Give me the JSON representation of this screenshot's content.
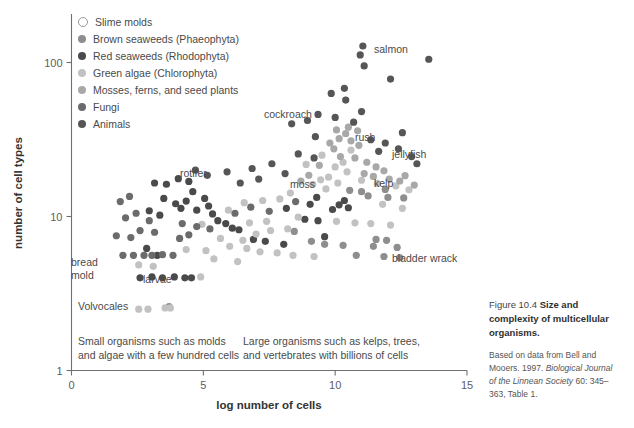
{
  "figure": {
    "number": "Figure 10.4",
    "title": "Size and complexity of multicellular organisms.",
    "source_prefix": "Based on data from Bell and Mooers. 1997. ",
    "source_italic": "Biological Journal of the Linnean Society",
    "source_suffix": " 60: 345–363, Table 1."
  },
  "legend": {
    "items": [
      {
        "label": "Slime molds",
        "color": "#ffffff",
        "outline": "#9a9a9a",
        "hollow": true
      },
      {
        "label": "Brown seaweeds (Phaeophyta)",
        "color": "#8e8e8e",
        "hollow": false
      },
      {
        "label": "Red seaweeds (Rhodophyta)",
        "color": "#4a4a4a",
        "hollow": false
      },
      {
        "label": "Green algae (Chlorophyta)",
        "color": "#c2c2c2",
        "hollow": false
      },
      {
        "label": "Mosses, ferns, and seed plants",
        "color": "#a8a8a8",
        "hollow": false
      },
      {
        "label": "Fungi",
        "color": "#6b6b6b",
        "hollow": false
      },
      {
        "label": "Animals",
        "color": "#565656",
        "hollow": false
      }
    ]
  },
  "annotations": [
    {
      "text": "salmon",
      "x": 374,
      "y": 43
    },
    {
      "text": "cockroach",
      "x": 264,
      "y": 108
    },
    {
      "text": "rush",
      "x": 355,
      "y": 131
    },
    {
      "text": "jellyfish",
      "x": 392,
      "y": 148
    },
    {
      "text": "rotifer",
      "x": 180,
      "y": 167
    },
    {
      "text": "moss",
      "x": 290,
      "y": 178
    },
    {
      "text": "kelp",
      "x": 374,
      "y": 177
    },
    {
      "text": "bladder wrack",
      "x": 392,
      "y": 252
    },
    {
      "text": "bread\nmold",
      "x": 71,
      "y": 256
    },
    {
      "text": "larvae",
      "x": 143,
      "y": 273
    },
    {
      "text": "Volvocales",
      "x": 78,
      "y": 300
    }
  ],
  "region_notes": [
    {
      "text": "Small organisms such as molds\nand algae with a few hundred cells",
      "x": 78,
      "y": 335
    },
    {
      "text": "Large organisms such as kelps, trees,\nand vertebrates with billions of cells",
      "x": 243,
      "y": 335
    }
  ],
  "chart_data": {
    "type": "scatter",
    "title": "Size and complexity of multicellular organisms",
    "xlabel": "log number of cells",
    "ylabel": "number of cell types",
    "xlim": [
      0,
      15
    ],
    "ylim": [
      1,
      200
    ],
    "yscale": "log",
    "xticks": [
      0,
      5,
      10,
      15
    ],
    "yticks": [
      1,
      10,
      100
    ],
    "grid": false,
    "legend_position": "top-left",
    "series": [
      {
        "name": "Slime molds",
        "color": "#ffffff",
        "outline": "#8f8f8f",
        "hollow": true,
        "points": [
          [
            4.05,
            2.55
          ]
        ]
      },
      {
        "name": "Brown seaweeds (Phaeophyta)",
        "color": "#8e8e8e",
        "points": [
          [
            3.7,
            2.6
          ],
          [
            11.0,
            14.5
          ],
          [
            11.25,
            13.6
          ],
          [
            12.0,
            13.3
          ],
          [
            10.55,
            14.8
          ],
          [
            11.55,
            7.1
          ],
          [
            11.95,
            7.0
          ],
          [
            11.45,
            6.4
          ],
          [
            12.35,
            6.3
          ],
          [
            9.1,
            6.9
          ],
          [
            9.6,
            6.6
          ],
          [
            10.3,
            6.5
          ],
          [
            12.6,
            13.2
          ],
          [
            11.9,
            15.0
          ],
          [
            8.45,
            8.0
          ],
          [
            10.8,
            5.6
          ],
          [
            11.85,
            5.5
          ],
          [
            12.45,
            5.4
          ]
        ]
      },
      {
        "name": "Red seaweeds (Rhodophyta)",
        "color": "#4a4a4a",
        "points": [
          [
            2.6,
            4.0
          ],
          [
            3.05,
            4.05
          ],
          [
            3.45,
            4.0
          ],
          [
            3.9,
            4.05
          ],
          [
            4.3,
            4.0
          ],
          [
            3.25,
            5.6
          ],
          [
            4.55,
            4.0
          ],
          [
            2.85,
            6.2
          ],
          [
            3.5,
            13.1
          ],
          [
            3.95,
            12.1
          ],
          [
            4.35,
            12.6
          ],
          [
            4.6,
            14.5
          ],
          [
            4.15,
            11.3
          ],
          [
            4.75,
            11.0
          ],
          [
            5.05,
            13.1
          ],
          [
            5.35,
            10.4
          ],
          [
            5.55,
            9.4
          ],
          [
            5.85,
            9.0
          ],
          [
            6.1,
            8.4
          ],
          [
            5.2,
            11.7
          ],
          [
            3.15,
            16.5
          ],
          [
            3.6,
            16.2
          ],
          [
            4.05,
            17.6
          ],
          [
            4.45,
            16.9
          ],
          [
            2.95,
            10.9
          ],
          [
            3.35,
            10.2
          ],
          [
            6.35,
            8.2
          ],
          [
            9.3,
            13.3
          ],
          [
            9.05,
            12.0
          ],
          [
            8.15,
            11.3
          ],
          [
            8.85,
            9.6
          ],
          [
            9.35,
            9.4
          ],
          [
            6.9,
            7.1
          ],
          [
            7.35,
            6.9
          ],
          [
            8.05,
            6.6
          ],
          [
            9.9,
            11.1
          ],
          [
            10.15,
            11.9
          ],
          [
            10.5,
            11.4
          ],
          [
            10.35,
            12.7
          ],
          [
            9.6,
            7.4
          ]
        ]
      },
      {
        "name": "Green algae (Chlorophyta)",
        "color": "#c2c2c2",
        "points": [
          [
            2.55,
            2.5
          ],
          [
            2.9,
            2.5
          ],
          [
            3.55,
            2.55
          ],
          [
            3.75,
            2.55
          ],
          [
            2.55,
            4.85
          ],
          [
            3.1,
            4.75
          ],
          [
            4.9,
            4.05
          ],
          [
            5.4,
            5.3
          ],
          [
            6.3,
            5.1
          ],
          [
            4.35,
            6.1
          ],
          [
            5.1,
            6.0
          ],
          [
            6.0,
            6.4
          ],
          [
            6.65,
            6.2
          ],
          [
            7.15,
            5.9
          ],
          [
            7.8,
            5.8
          ],
          [
            8.4,
            5.6
          ],
          [
            9.2,
            5.5
          ],
          [
            5.65,
            7.2
          ],
          [
            6.5,
            7.0
          ],
          [
            7.0,
            7.7
          ],
          [
            7.55,
            8.1
          ],
          [
            8.2,
            8.3
          ],
          [
            6.75,
            9.1
          ],
          [
            7.4,
            9.3
          ],
          [
            8.6,
            9.9
          ],
          [
            10.05,
            9.3
          ],
          [
            10.75,
            9.1
          ],
          [
            11.35,
            9.0
          ],
          [
            12.1,
            8.8
          ],
          [
            9.45,
            17.3
          ],
          [
            9.75,
            18.0
          ],
          [
            10.1,
            16.5
          ],
          [
            10.45,
            19.5
          ],
          [
            10.0,
            21.0
          ],
          [
            10.3,
            22.5
          ],
          [
            9.65,
            15.1
          ],
          [
            11.0,
            17.2
          ],
          [
            11.6,
            16.4
          ],
          [
            12.3,
            15.8
          ],
          [
            12.8,
            14.9
          ],
          [
            8.9,
            21.8
          ],
          [
            9.5,
            25.0
          ],
          [
            10.6,
            27.0
          ],
          [
            7.9,
            13.0
          ],
          [
            8.3,
            14.2
          ],
          [
            9.15,
            16.2
          ],
          [
            11.8,
            12.0
          ],
          [
            12.55,
            11.3
          ],
          [
            5.95,
            11.0
          ],
          [
            6.55,
            12.3
          ],
          [
            7.25,
            12.7
          ],
          [
            4.95,
            8.9
          ]
        ]
      },
      {
        "name": "Mosses, ferns, and seed plants",
        "color": "#a8a8a8",
        "points": [
          [
            9.8,
            30.0
          ],
          [
            10.15,
            32.0
          ],
          [
            10.4,
            34.5
          ],
          [
            10.05,
            36.5
          ],
          [
            10.6,
            31.0
          ],
          [
            10.9,
            29.0
          ],
          [
            9.95,
            27.5
          ],
          [
            10.75,
            24.0
          ],
          [
            11.2,
            22.5
          ],
          [
            11.55,
            21.0
          ],
          [
            10.2,
            24.5
          ],
          [
            9.4,
            21.5
          ],
          [
            11.1,
            19.0
          ],
          [
            11.45,
            18.2
          ],
          [
            12.05,
            17.5
          ],
          [
            12.45,
            17.0
          ],
          [
            9.0,
            18.5
          ],
          [
            8.7,
            17.0
          ],
          [
            11.85,
            19.8
          ],
          [
            12.65,
            18.4
          ],
          [
            13.0,
            16.0
          ],
          [
            10.85,
            36.0
          ],
          [
            10.5,
            38.0
          ]
        ]
      },
      {
        "name": "Fungi",
        "color": "#6b6b6b",
        "points": [
          [
            1.95,
            5.6
          ],
          [
            2.35,
            5.6
          ],
          [
            2.75,
            5.6
          ],
          [
            3.05,
            5.6
          ],
          [
            3.45,
            5.65
          ],
          [
            3.85,
            5.6
          ],
          [
            1.7,
            7.5
          ],
          [
            2.25,
            7.3
          ],
          [
            2.6,
            8.1
          ],
          [
            3.15,
            7.9
          ],
          [
            4.1,
            7.2
          ],
          [
            4.45,
            7.6
          ],
          [
            2.05,
            9.8
          ],
          [
            2.45,
            10.5
          ],
          [
            2.95,
            9.4
          ],
          [
            4.75,
            8.6
          ],
          [
            5.25,
            8.3
          ],
          [
            1.85,
            12.5
          ],
          [
            2.2,
            13.5
          ],
          [
            6.2,
            10.5
          ],
          [
            6.8,
            11.5
          ],
          [
            7.5,
            10.8
          ],
          [
            8.5,
            12.5
          ],
          [
            4.2,
            9.0
          ]
        ]
      },
      {
        "name": "Animals",
        "color": "#565656",
        "points": [
          [
            10.95,
            112.0
          ],
          [
            11.05,
            128.0
          ],
          [
            11.1,
            95.0
          ],
          [
            13.55,
            105.0
          ],
          [
            12.1,
            78.0
          ],
          [
            10.4,
            57.0
          ],
          [
            9.85,
            63.0
          ],
          [
            10.35,
            68.0
          ],
          [
            9.35,
            46.0
          ],
          [
            10.0,
            44.0
          ],
          [
            11.0,
            48.0
          ],
          [
            8.95,
            42.0
          ],
          [
            8.35,
            40.0
          ],
          [
            9.25,
            33.0
          ],
          [
            11.35,
            31.5
          ],
          [
            11.9,
            30.0
          ],
          [
            12.4,
            27.5
          ],
          [
            8.6,
            25.5
          ],
          [
            9.2,
            24.0
          ],
          [
            7.6,
            22.0
          ],
          [
            6.85,
            20.5
          ],
          [
            5.9,
            19.5
          ],
          [
            5.15,
            18.5
          ],
          [
            4.7,
            20.0
          ],
          [
            12.9,
            24.5
          ],
          [
            11.65,
            26.5
          ],
          [
            10.7,
            41.0
          ],
          [
            12.55,
            35.0
          ],
          [
            7.1,
            17.5
          ],
          [
            6.4,
            16.5
          ],
          [
            8.1,
            19.0
          ],
          [
            13.1,
            22.0
          ]
        ]
      }
    ]
  }
}
